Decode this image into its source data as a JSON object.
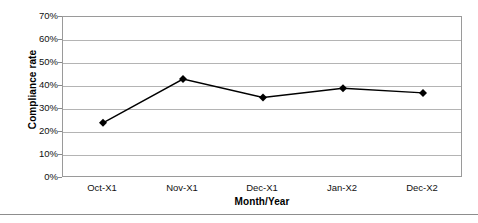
{
  "chart_data": {
    "type": "line",
    "title": "",
    "categories": [
      "Oct-X1",
      "Nov-X1",
      "Dec-X1",
      "Jan-X2",
      "Dec-X2"
    ],
    "values": [
      24,
      43,
      35,
      39,
      37
    ],
    "series": [
      {
        "name": "Compliance rate",
        "values": [
          24,
          43,
          35,
          39,
          37
        ]
      }
    ],
    "xlabel": "Month/Year",
    "ylabel": "Compliance rate",
    "ylim": [
      0,
      70
    ],
    "yticks": [
      0,
      10,
      20,
      30,
      40,
      50,
      60,
      70
    ],
    "ytick_labels": [
      "0%",
      "10%",
      "20%",
      "30%",
      "40%",
      "50%",
      "60%",
      "70%"
    ],
    "value_suffix": "%",
    "grid": true,
    "grid_axis": "y",
    "legend": false,
    "legend_position": "none",
    "marker": "diamond",
    "line_color": "#000000",
    "marker_color": "#000000",
    "grid_color": "#b4b4b4",
    "frame_color": "#9a9a9a",
    "background": "#ffffff"
  },
  "footer": {
    "rule_color": "#8d8d8d"
  }
}
